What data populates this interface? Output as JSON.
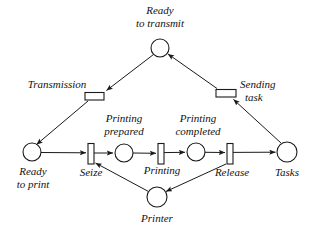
{
  "diagram": {
    "type": "petri-net",
    "stroke_color": "#1a1a1a",
    "fill_color": "#ffffff",
    "places": [
      {
        "id": "ready_to_transmit",
        "label_line1": "Ready",
        "label_line2": "to transmit",
        "cx": 160,
        "cy": 48,
        "r": 9,
        "tokens": 0
      },
      {
        "id": "ready_to_print",
        "label_line1": "Ready",
        "label_line2": "to print",
        "cx": 32,
        "cy": 152,
        "r": 9,
        "tokens": 0
      },
      {
        "id": "printing_prepared",
        "label_line1": "Printing",
        "label_line2": "prepared",
        "cx": 124,
        "cy": 153,
        "r": 9,
        "tokens": 0
      },
      {
        "id": "printing_completed",
        "label_line1": "Printing",
        "label_line2": "completed",
        "cx": 196,
        "cy": 152,
        "r": 9,
        "tokens": 0
      },
      {
        "id": "tasks",
        "label_line1": "Tasks",
        "label_line2": "",
        "cx": 287,
        "cy": 152,
        "r": 10,
        "tokens": 0
      },
      {
        "id": "printer",
        "label_line1": "Printer",
        "label_line2": "",
        "cx": 157,
        "cy": 197,
        "r": 10,
        "tokens": 0
      }
    ],
    "transitions": [
      {
        "id": "transmission",
        "label": "Transmission",
        "x": 85,
        "y": 92,
        "w": 19,
        "h": 8,
        "orient": "horizontal"
      },
      {
        "id": "sending_task",
        "label": "Sending task",
        "label_line1": "Sending",
        "label_line2": "task",
        "x": 216,
        "y": 89,
        "w": 20,
        "h": 8,
        "orient": "horizontal"
      },
      {
        "id": "seize",
        "label": "Seize",
        "x": 88,
        "y": 143,
        "w": 6,
        "h": 21,
        "orient": "vertical"
      },
      {
        "id": "printing",
        "label": "Printing",
        "x": 158,
        "y": 143,
        "w": 6,
        "h": 21,
        "orient": "vertical"
      },
      {
        "id": "release",
        "label": "Release",
        "x": 227,
        "y": 143,
        "w": 6,
        "h": 21,
        "orient": "vertical"
      }
    ],
    "arcs": [
      {
        "from": "ready_to_transmit",
        "to": "transmission"
      },
      {
        "from": "transmission",
        "to": "ready_to_print"
      },
      {
        "from": "ready_to_print",
        "to": "seize"
      },
      {
        "from": "seize",
        "to": "printing_prepared"
      },
      {
        "from": "printing_prepared",
        "to": "printing"
      },
      {
        "from": "printing",
        "to": "printing_completed"
      },
      {
        "from": "printing_completed",
        "to": "release"
      },
      {
        "from": "release",
        "to": "tasks"
      },
      {
        "from": "release",
        "to": "printer"
      },
      {
        "from": "printer",
        "to": "seize"
      },
      {
        "from": "tasks",
        "to": "sending_task"
      },
      {
        "from": "sending_task",
        "to": "ready_to_transmit"
      }
    ],
    "labels": {
      "ready_to_transmit_l1": "Ready",
      "ready_to_transmit_l2": "to transmit",
      "transmission": "Transmission",
      "sending_l1": "Sending",
      "sending_l2": "task",
      "ready_to_print_l1": "Ready",
      "ready_to_print_l2": "to print",
      "seize": "Seize",
      "printing_prepared_l1": "Printing",
      "printing_prepared_l2": "prepared",
      "printing": "Printing",
      "printing_completed_l1": "Printing",
      "printing_completed_l2": "completed",
      "release": "Release",
      "tasks": "Tasks",
      "printer": "Printer"
    }
  }
}
